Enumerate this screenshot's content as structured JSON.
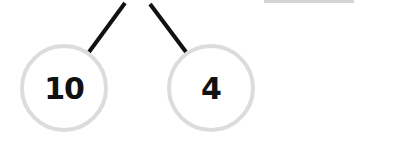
{
  "diagram": {
    "type": "number-bond",
    "nodes": [
      {
        "id": "left",
        "value": "10",
        "cx": 64,
        "cy": 88
      },
      {
        "id": "right",
        "value": "4",
        "cx": 211,
        "cy": 88
      }
    ],
    "edges": [
      {
        "from": "parent",
        "to": "left",
        "x1": 125,
        "y1": 3,
        "x2": 89,
        "y2": 52
      },
      {
        "from": "parent",
        "to": "right",
        "x1": 150,
        "y1": 4,
        "x2": 186,
        "y2": 52
      }
    ],
    "colors": {
      "edge": "#111111",
      "node_border": "#dcdcdc",
      "text": "#111111",
      "top_bar": "#d4d4d4"
    }
  }
}
